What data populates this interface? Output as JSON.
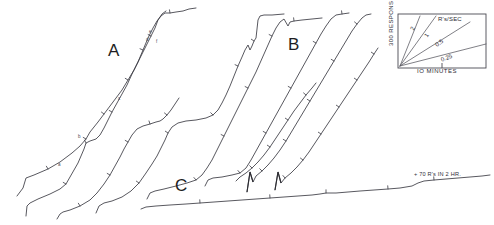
{
  "figure": {
    "kind": "cumulative-response-record",
    "background_color": "#ffffff",
    "ink_color": "#3a3a42"
  },
  "group_labels": {
    "a": "A",
    "b": "B",
    "c": "C"
  },
  "segment_labels": {
    "a": "a",
    "b": "b",
    "c": "c",
    "d": "d",
    "e": "e",
    "f": "f"
  },
  "annotation": {
    "text": "+ 70 R's IN 2 HR."
  },
  "legend": {
    "y_axis_label": "300 RESPONSES",
    "x_axis_label": "IO MINUTES",
    "rate_unit_label": "R's/SEC",
    "rates": [
      {
        "value": "2",
        "slope_deg": 68
      },
      {
        "value": "1",
        "slope_deg": 56
      },
      {
        "value": "0.5",
        "slope_deg": 37
      },
      {
        "value": "0.25",
        "slope_deg": 20
      }
    ]
  },
  "chart_data": {
    "type": "line",
    "title": "",
    "subtitle": "",
    "xlabel": "IO MINUTES",
    "ylabel": "300 RESPONSES",
    "legend_position": "top-right-inset",
    "grid": false,
    "axis_note": "Cumulative record: x = time, y = cumulative responses. Each record is pen-reset and offset; only relative slope (response rate) is meaningful.",
    "rate_calibration_unit": "R's/SEC",
    "rate_calibration_values": [
      2,
      1,
      0.5,
      0.25
    ],
    "annotations": [
      {
        "text": "+ 70 R's IN 2 HR.",
        "attached_to": "C",
        "x": 414,
        "y": 171
      },
      {
        "text": "A",
        "attached_to": "group-A",
        "x": 108,
        "y": 42
      },
      {
        "text": "B",
        "attached_to": "group-B",
        "x": 288,
        "y": 36
      },
      {
        "text": "C",
        "attached_to": "group-C",
        "x": 175,
        "y": 177
      },
      {
        "text": "a",
        "attached_to": "curve-A1",
        "x": 58,
        "y": 163
      },
      {
        "text": "b",
        "attached_to": "curve-A1",
        "x": 78,
        "y": 135
      },
      {
        "text": "c",
        "attached_to": "curve-A1",
        "x": 118,
        "y": 97
      },
      {
        "text": "d",
        "attached_to": "curve-A1",
        "x": 146,
        "y": 38
      },
      {
        "text": "e",
        "attached_to": "curve-A1",
        "x": 149,
        "y": 30
      },
      {
        "text": "f",
        "attached_to": "curve-A2",
        "x": 156,
        "y": 40
      }
    ],
    "series": [
      {
        "name": "A1",
        "group": "A",
        "points": [
          [
            17,
            196
          ],
          [
            23,
            188
          ],
          [
            26,
            178
          ],
          [
            34,
            175
          ],
          [
            48,
            169
          ],
          [
            60,
            162
          ],
          [
            72,
            153
          ],
          [
            80,
            146
          ],
          [
            86,
            139
          ],
          [
            90,
            132
          ],
          [
            94,
            127
          ],
          [
            98,
            122
          ],
          [
            104,
            114
          ],
          [
            110,
            106
          ],
          [
            116,
            98
          ],
          [
            122,
            90
          ],
          [
            128,
            80
          ],
          [
            134,
            70
          ],
          [
            140,
            58
          ],
          [
            146,
            46
          ],
          [
            151,
            36
          ],
          [
            155,
            28
          ],
          [
            158,
            20
          ],
          [
            162,
            14
          ],
          [
            166,
            11
          ]
        ]
      },
      {
        "name": "A2",
        "group": "A",
        "points": [
          [
            26,
            216
          ],
          [
            27,
            206
          ],
          [
            30,
            203
          ],
          [
            38,
            199
          ],
          [
            50,
            194
          ],
          [
            60,
            189
          ],
          [
            66,
            184
          ],
          [
            70,
            177
          ],
          [
            74,
            170
          ],
          [
            78,
            163
          ],
          [
            81,
            156
          ],
          [
            84,
            149
          ],
          [
            86,
            143
          ],
          [
            90,
            141
          ],
          [
            96,
            139
          ],
          [
            100,
            135
          ],
          [
            104,
            128
          ],
          [
            108,
            120
          ],
          [
            112,
            112
          ],
          [
            117,
            103
          ],
          [
            122,
            94
          ],
          [
            127,
            85
          ],
          [
            132,
            74
          ],
          [
            138,
            62
          ],
          [
            143,
            50
          ],
          [
            148,
            38
          ],
          [
            153,
            28
          ],
          [
            157,
            21
          ],
          [
            161,
            16
          ],
          [
            165,
            13
          ],
          [
            170,
            13
          ],
          [
            176,
            12
          ],
          [
            183,
            11
          ],
          [
            189,
            9
          ],
          [
            196,
            8
          ]
        ]
      },
      {
        "name": "A3",
        "group": "A",
        "points": [
          [
            57,
            219
          ],
          [
            60,
            214
          ],
          [
            63,
            212
          ],
          [
            70,
            210
          ],
          [
            80,
            206
          ],
          [
            90,
            200
          ],
          [
            97,
            193
          ],
          [
            104,
            184
          ],
          [
            110,
            175
          ],
          [
            115,
            166
          ],
          [
            120,
            157
          ],
          [
            124,
            149
          ],
          [
            128,
            142
          ],
          [
            132,
            135
          ],
          [
            137,
            129
          ],
          [
            143,
            126
          ],
          [
            150,
            124
          ],
          [
            156,
            122
          ],
          [
            160,
            121
          ],
          [
            163,
            119
          ],
          [
            167,
            115
          ],
          [
            171,
            110
          ],
          [
            175,
            104
          ],
          [
            179,
            98
          ]
        ]
      },
      {
        "name": "B1",
        "group": "B",
        "points": [
          [
            96,
            213
          ],
          [
            99,
            206
          ],
          [
            104,
            203
          ],
          [
            112,
            201
          ],
          [
            122,
            197
          ],
          [
            131,
            191
          ],
          [
            139,
            183
          ],
          [
            146,
            173
          ],
          [
            152,
            164
          ],
          [
            157,
            156
          ],
          [
            161,
            148
          ],
          [
            165,
            140
          ],
          [
            168,
            133
          ],
          [
            172,
            127
          ],
          [
            178,
            123
          ],
          [
            186,
            121
          ],
          [
            196,
            120
          ],
          [
            206,
            118
          ],
          [
            213,
            115
          ],
          [
            218,
            110
          ],
          [
            222,
            103
          ],
          [
            226,
            95
          ],
          [
            230,
            86
          ],
          [
            234,
            76
          ],
          [
            238,
            66
          ],
          [
            242,
            57
          ],
          [
            245,
            50
          ],
          [
            248,
            45
          ],
          [
            250,
            50
          ],
          [
            252,
            46
          ],
          [
            254,
            41
          ],
          [
            256,
            38
          ],
          [
            258,
            20
          ],
          [
            260,
            16
          ],
          [
            264,
            15
          ],
          [
            272,
            15
          ],
          [
            284,
            14
          ]
        ]
      },
      {
        "name": "B2",
        "group": "B",
        "points": [
          [
            147,
            199
          ],
          [
            150,
            193
          ],
          [
            155,
            191
          ],
          [
            164,
            189
          ],
          [
            176,
            186
          ],
          [
            187,
            183
          ],
          [
            196,
            180
          ],
          [
            202,
            175
          ],
          [
            207,
            168
          ],
          [
            212,
            160
          ],
          [
            216,
            152
          ],
          [
            220,
            144
          ],
          [
            224,
            136
          ],
          [
            228,
            128
          ],
          [
            232,
            120
          ],
          [
            236,
            112
          ],
          [
            240,
            104
          ],
          [
            244,
            96
          ],
          [
            248,
            88
          ],
          [
            252,
            80
          ],
          [
            256,
            72
          ],
          [
            260,
            63
          ],
          [
            264,
            54
          ],
          [
            268,
            45
          ],
          [
            272,
            36
          ],
          [
            276,
            28
          ],
          [
            280,
            22
          ],
          [
            284,
            19
          ],
          [
            288,
            26
          ],
          [
            290,
            22
          ],
          [
            294,
            21
          ],
          [
            302,
            20
          ],
          [
            312,
            19
          ],
          [
            322,
            18
          ]
        ]
      },
      {
        "name": "B3",
        "group": "B",
        "points": [
          [
            205,
            186
          ],
          [
            208,
            180
          ],
          [
            213,
            178
          ],
          [
            222,
            177
          ],
          [
            232,
            175
          ],
          [
            240,
            173
          ],
          [
            246,
            168
          ],
          [
            251,
            160
          ],
          [
            256,
            151
          ],
          [
            261,
            142
          ],
          [
            266,
            133
          ],
          [
            271,
            124
          ],
          [
            276,
            115
          ],
          [
            281,
            106
          ],
          [
            286,
            97
          ],
          [
            291,
            88
          ],
          [
            296,
            79
          ],
          [
            301,
            70
          ],
          [
            306,
            61
          ],
          [
            311,
            52
          ],
          [
            316,
            43
          ],
          [
            321,
            34
          ],
          [
            326,
            26
          ],
          [
            331,
            19
          ],
          [
            336,
            15
          ],
          [
            342,
            14
          ],
          [
            349,
            13
          ]
        ]
      },
      {
        "name": "B4",
        "group": "B",
        "points": [
          [
            247,
            192
          ],
          [
            250,
            172
          ],
          [
            253,
            182
          ],
          [
            256,
            176
          ],
          [
            262,
            171
          ],
          [
            268,
            165
          ],
          [
            274,
            158
          ],
          [
            280,
            150
          ],
          [
            286,
            141
          ],
          [
            292,
            131
          ],
          [
            298,
            121
          ],
          [
            304,
            111
          ],
          [
            310,
            101
          ],
          [
            316,
            91
          ],
          [
            322,
            81
          ],
          [
            328,
            71
          ],
          [
            334,
            61
          ],
          [
            340,
            51
          ],
          [
            346,
            41
          ],
          [
            352,
            31
          ],
          [
            357,
            24
          ],
          [
            362,
            18
          ],
          [
            366,
            15
          ],
          [
            371,
            14
          ]
        ]
      },
      {
        "name": "B5",
        "group": "B",
        "points": [
          [
            275,
            190
          ],
          [
            278,
            172
          ],
          [
            281,
            183
          ],
          [
            285,
            178
          ],
          [
            291,
            173
          ],
          [
            297,
            167
          ],
          [
            303,
            160
          ],
          [
            309,
            152
          ],
          [
            315,
            143
          ],
          [
            321,
            134
          ],
          [
            327,
            125
          ],
          [
            333,
            116
          ],
          [
            339,
            107
          ],
          [
            345,
            98
          ],
          [
            351,
            89
          ],
          [
            357,
            80
          ],
          [
            363,
            71
          ],
          [
            369,
            62
          ],
          [
            374,
            54
          ],
          [
            378,
            48
          ]
        ]
      },
      {
        "name": "B6",
        "group": "B",
        "points": [
          [
            236,
            181
          ],
          [
            240,
            177
          ],
          [
            246,
            173
          ],
          [
            252,
            168
          ],
          [
            258,
            162
          ],
          [
            264,
            155
          ],
          [
            270,
            147
          ],
          [
            276,
            138
          ],
          [
            282,
            129
          ],
          [
            288,
            120
          ],
          [
            294,
            111
          ],
          [
            300,
            103
          ],
          [
            306,
            95
          ],
          [
            312,
            88
          ],
          [
            316,
            83
          ]
        ]
      },
      {
        "name": "C1",
        "group": "C",
        "points": [
          [
            141,
            209
          ],
          [
            146,
            207
          ],
          [
            156,
            206
          ],
          [
            170,
            205
          ],
          [
            186,
            204
          ],
          [
            200,
            203
          ],
          [
            214,
            202
          ],
          [
            228,
            201
          ],
          [
            242,
            200
          ],
          [
            256,
            199
          ],
          [
            270,
            198
          ],
          [
            284,
            197
          ],
          [
            298,
            196
          ],
          [
            312,
            195
          ],
          [
            320,
            194
          ],
          [
            326,
            193
          ],
          [
            336,
            193
          ],
          [
            348,
            192
          ],
          [
            360,
            191
          ],
          [
            374,
            190
          ],
          [
            388,
            189
          ],
          [
            400,
            188
          ],
          [
            412,
            186
          ],
          [
            418,
            183
          ],
          [
            424,
            181
          ],
          [
            434,
            180
          ],
          [
            446,
            179
          ],
          [
            458,
            178
          ],
          [
            470,
            177
          ],
          [
            482,
            176
          ],
          [
            490,
            175
          ]
        ]
      }
    ]
  }
}
